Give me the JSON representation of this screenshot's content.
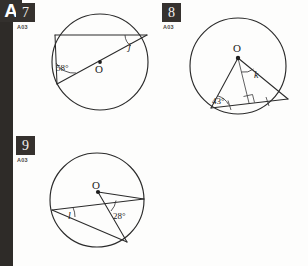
{
  "page": {
    "section_letter": "A",
    "background_color": "#fdfdfc",
    "ink_color": "#2b2b2b",
    "chip_color": "#35312e"
  },
  "questions": [
    {
      "number": "7",
      "code": "A03",
      "center_label": "O",
      "angles": [
        {
          "label": "58°",
          "name": "angle-58"
        },
        {
          "label": "j",
          "name": "angle-j"
        }
      ]
    },
    {
      "number": "8",
      "code": "A03",
      "center_label": "O",
      "angles": [
        {
          "label": "43°",
          "name": "angle-43"
        },
        {
          "label": "k",
          "name": "angle-k"
        }
      ]
    },
    {
      "number": "9",
      "code": "A03",
      "center_label": "O",
      "angles": [
        {
          "label": "28°",
          "name": "angle-28"
        },
        {
          "label": "l",
          "name": "angle-l"
        }
      ]
    }
  ],
  "figure_geometry": {
    "fig7": {
      "circle": {
        "cx": 100,
        "cy": 62,
        "r": 48
      },
      "center_dot": {
        "x": 100,
        "y": 62
      },
      "chord_top": {
        "x1": 55,
        "y1": 35,
        "x2": 147,
        "y2": 35
      },
      "diameter": {
        "x1": 58,
        "y1": 84,
        "x2": 147,
        "y2": 35
      },
      "chord_left": {
        "x1": 55,
        "y1": 35,
        "x2": 58,
        "y2": 84
      }
    },
    "fig8": {
      "circle": {
        "cx": 238,
        "cy": 66,
        "r": 48
      },
      "center_dot": {
        "x": 238,
        "y": 58
      },
      "vertex_left": {
        "x": 211,
        "y": 108
      },
      "vertex_right": {
        "x": 288,
        "y": 99
      },
      "base_mid": {
        "x": 249,
        "y": 103
      },
      "right_angle_mark": true,
      "tick_marks": 2
    },
    "fig9": {
      "circle": {
        "cx": 97,
        "cy": 200,
        "r": 47
      },
      "center_dot": {
        "x": 98,
        "y": 192
      },
      "vertex_left": {
        "x": 52,
        "y": 210
      },
      "vertex_right": {
        "x": 144,
        "y": 199
      },
      "vertex_bottom": {
        "x": 127,
        "y": 242
      }
    }
  }
}
